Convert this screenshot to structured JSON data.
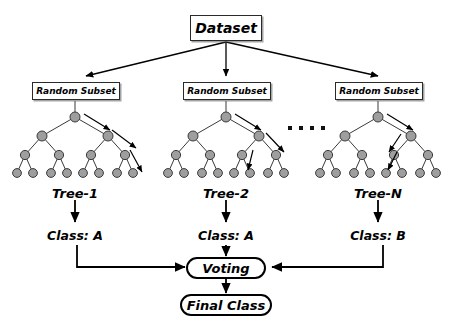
{
  "diagram": {
    "title_node": "Dataset",
    "subsets": [
      {
        "label": "Random Subset"
      },
      {
        "label": "Random Subset"
      },
      {
        "label": "Random Subset"
      }
    ],
    "trees": [
      {
        "name": "Tree-1",
        "class_label": "Class: A"
      },
      {
        "name": "Tree-2",
        "class_label": "Class: A"
      },
      {
        "name": "Tree-N",
        "class_label": "Class: B"
      }
    ],
    "ellipsis": "••••",
    "voting": "Voting",
    "final": "Final Class",
    "colors": {
      "node_fill": "#9e9e9e",
      "node_stroke": "#3a3a3a",
      "edge": "#3a3a3a",
      "arrow": "#000000",
      "box_border": "#2a2a2a",
      "background": "#ffffff",
      "shadow": "#5a5a5a"
    },
    "structure": {
      "tree_depth": 4,
      "leaf_count": 8,
      "node_count": 15,
      "tree_count": 3
    }
  }
}
